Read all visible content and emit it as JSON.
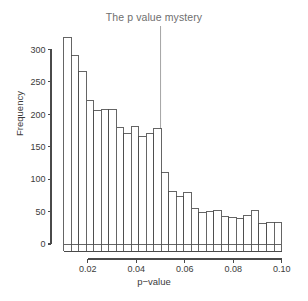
{
  "chart_data": {
    "type": "bar",
    "title": "The p value mystery",
    "xlabel": "p−value",
    "ylabel": "Frequency",
    "grid": false,
    "legend": false,
    "xlim": [
      0.0075,
      0.1005
    ],
    "ylim": [
      0,
      330
    ],
    "bin_width": 0.0031,
    "bin_starts": [
      0.01,
      0.0131,
      0.0162,
      0.0193,
      0.0224,
      0.0255,
      0.0286,
      0.0317,
      0.0348,
      0.0379,
      0.041,
      0.0441,
      0.0472,
      0.0503,
      0.0534,
      0.0565,
      0.0596,
      0.0627,
      0.0658,
      0.0689,
      0.072,
      0.0751,
      0.0782,
      0.0813,
      0.0844,
      0.0875,
      0.0906,
      0.0937,
      0.0968
    ],
    "categories": [
      "0.0100",
      "0.0131",
      "0.0162",
      "0.0193",
      "0.0224",
      "0.0255",
      "0.0286",
      "0.0317",
      "0.0348",
      "0.0379",
      "0.0410",
      "0.0441",
      "0.0472",
      "0.0503",
      "0.0534",
      "0.0565",
      "0.0596",
      "0.0627",
      "0.0658",
      "0.0689",
      "0.0720",
      "0.0751",
      "0.0782",
      "0.0813",
      "0.0844",
      "0.0875",
      "0.0906",
      "0.0937",
      "0.0968"
    ],
    "values": [
      318,
      290,
      266,
      222,
      206,
      208,
      208,
      180,
      171,
      181,
      166,
      171,
      178,
      110,
      81,
      73,
      80,
      55,
      48,
      50,
      51,
      43,
      41,
      40,
      44,
      51,
      31,
      33,
      33
    ],
    "y_ticks": [
      0,
      50,
      100,
      150,
      200,
      250,
      300
    ],
    "y_tick_labels": [
      "0",
      "50",
      "100",
      "150",
      "200",
      "250",
      "300"
    ],
    "x_ticks": [
      0.02,
      0.04,
      0.06,
      0.08,
      0.1
    ],
    "x_tick_labels": [
      "0.02",
      "0.04",
      "0.06",
      "0.08",
      "0.10"
    ],
    "x_minor_ticks": [
      0.01,
      0.0131,
      0.0162,
      0.0193,
      0.0224,
      0.0255,
      0.0286,
      0.0317,
      0.0348,
      0.0379,
      0.041,
      0.0441,
      0.0472,
      0.0503,
      0.0534,
      0.0565,
      0.0596,
      0.0627,
      0.0658,
      0.0689,
      0.072,
      0.0751,
      0.0782,
      0.0813,
      0.0844,
      0.0875,
      0.0906,
      0.0937,
      0.0968,
      0.0999
    ],
    "annotations": [
      {
        "name": "significance-threshold-line",
        "type": "vline",
        "x": 0.05,
        "label": ""
      }
    ],
    "colors": {
      "bar_fill": "#ffffff",
      "bar_stroke": "#4a4a4a",
      "axis": "#4a4a4a",
      "title": "#6e6e6e",
      "text": "#3b3b3b",
      "vline": "#9a9a9a"
    }
  }
}
